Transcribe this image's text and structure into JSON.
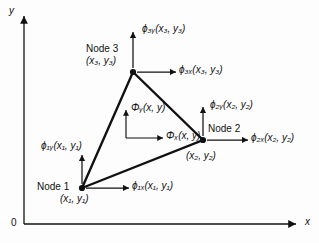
{
  "figure": {
    "type": "finite-element-triangle-dof-diagram",
    "background_color": "#fdfdfd",
    "ink_color": "#111111"
  },
  "axes": {
    "x_label": "x",
    "y_label": "y",
    "origin_label": "0",
    "x_axis": {
      "from": [
        24,
        224
      ],
      "to": [
        300,
        224
      ],
      "arrow": "right"
    },
    "y_axis": {
      "from": [
        24,
        224
      ],
      "to": [
        24,
        12
      ],
      "arrow": "up"
    }
  },
  "element": {
    "shape": "triangle",
    "vertices": [
      {
        "id": "node1",
        "px": [
          82,
          188
        ]
      },
      {
        "id": "node2",
        "px": [
          203,
          140
        ]
      },
      {
        "id": "node3",
        "px": [
          133,
          72
        ]
      }
    ]
  },
  "nodes": [
    {
      "id": "node1",
      "name_label": "Node 1",
      "coord_label": "(x₁, y₁)",
      "dof_x": "ϕ₁ₓ(x₁, y₁)",
      "dof_y": "ϕ₁ᵧ(x₁, y₁)"
    },
    {
      "id": "node2",
      "name_label": "Node 2",
      "coord_label": "(x₂, y₂)",
      "dof_x": "ϕ₂ₓ(x₂, y₂)",
      "dof_y": "ϕ₂ᵧ(x₂, y₂)"
    },
    {
      "id": "node3",
      "name_label": "Node 3",
      "coord_label": "(x₃, y₃)",
      "dof_x": "ϕ₃ₓ(x₃, y₃)",
      "dof_y": "ϕ₃ᵧ(x₃, y₃)"
    }
  ],
  "interior_point": {
    "field_x": "Φₓ(x, y)",
    "field_y": "Φᵧ(x, y)"
  }
}
